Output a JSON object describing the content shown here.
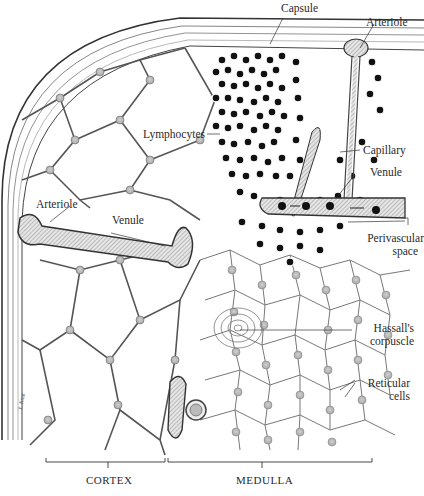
{
  "figure": {
    "labels": {
      "capsule": "Capsule",
      "arteriole_top": "Arteriole",
      "lymphocytes": "Lymphocytes",
      "capillary": "Capillary",
      "venule_right": "Venule",
      "arteriole_left": "Arteriole",
      "venule_left": "Venule",
      "perivascular_1": "Perivascular",
      "perivascular_2": "space",
      "hassall_1": "Hassall's",
      "hassall_2": "corpuscle",
      "reticular_1": "Reticular",
      "reticular_2": "cells"
    },
    "regions": {
      "cortex": "CORTEX",
      "medulla": "MEDULLA"
    },
    "colors": {
      "ink": "#2a2a2a",
      "cell_fill": "#d9d9d9",
      "nucleus": "#111111",
      "vessel_fill": "#bdbdbd"
    }
  }
}
